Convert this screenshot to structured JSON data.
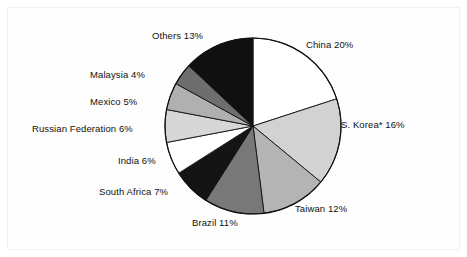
{
  "chart_data": {
    "type": "pie",
    "title": "",
    "subtitle": "",
    "xlabel": "",
    "ylabel": "",
    "legend_position": "none",
    "grid": false,
    "note": "S. Korea entry is marked with an asterisk",
    "categories": [
      "China",
      "S. Korea*",
      "Taiwan",
      "Brazil",
      "South Africa",
      "India",
      "Russian Federation",
      "Mexico",
      "Malaysia",
      "Others"
    ],
    "values": [
      20,
      16,
      12,
      11,
      7,
      6,
      6,
      5,
      4,
      13
    ],
    "slices": [
      {
        "label": "China 20%",
        "name": "China",
        "value": 20,
        "color": "#ffffff"
      },
      {
        "label": "S. Korea* 16%",
        "name": "S. Korea*",
        "value": 16,
        "color": "#d2d2d2"
      },
      {
        "label": "Taiwan 12%",
        "name": "Taiwan",
        "value": 12,
        "color": "#b4b4b4"
      },
      {
        "label": "Brazil 11%",
        "name": "Brazil",
        "value": 11,
        "color": "#787878"
      },
      {
        "label": "South Africa 7%",
        "name": "South Africa",
        "value": 7,
        "color": "#141414"
      },
      {
        "label": "India 6%",
        "name": "India",
        "value": 6,
        "color": "#ffffff"
      },
      {
        "label": "Russian Federation 6%",
        "name": "Russian Federation",
        "value": 6,
        "color": "#d7d7d7"
      },
      {
        "label": "Mexico 5%",
        "name": "Mexico",
        "value": 5,
        "color": "#b0b0b0"
      },
      {
        "label": "Malaysia 4%",
        "name": "Malaysia",
        "value": 4,
        "color": "#6e6e6e"
      },
      {
        "label": "Others 13%",
        "name": "Others",
        "value": 13,
        "color": "#101010"
      }
    ],
    "geometry": {
      "center_x": 253,
      "center_y": 126,
      "radius": 88,
      "start_angle_deg": 0,
      "direction": "clockwise"
    },
    "colors": {
      "outline": "#111111",
      "background": "#ffffff",
      "frame": "#f2f2f2",
      "text": "#111111"
    }
  }
}
